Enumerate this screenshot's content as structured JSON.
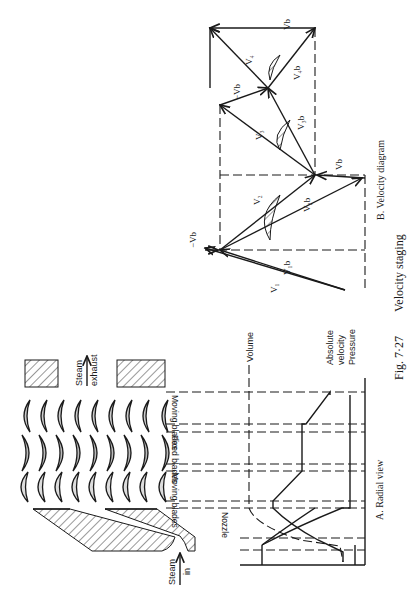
{
  "figure": {
    "number": "Fig. 7·27",
    "caption": "Velocity staging",
    "orientation": "rotated 90° clockwise (text reads bottom-to-top)"
  },
  "panel_a": {
    "title": "A. Radial view",
    "flow_labels": {
      "inlet": "Steam in",
      "inlet_line1": "Steam",
      "inlet_line2": "in",
      "exhaust_line1": "Steam",
      "exhaust_line2": "exhaust"
    },
    "sections": [
      "Nozzle",
      "Moving blades",
      "Fixed blades",
      "Moving blades"
    ],
    "curves": [
      "Volume",
      "Absolute velocity",
      "Pressure"
    ],
    "curve_label_volume": "Volume",
    "curve_label_velocity_1": "Absolute",
    "curve_label_velocity_2": "velocity",
    "curve_label_pressure": "Pressure"
  },
  "panel_b": {
    "title": "B. Velocity diagram",
    "vectors": [
      "V1",
      "V1b",
      "-Vb",
      "V2",
      "V2b",
      "Vb",
      "V3",
      "V3b",
      "-Vb",
      "V4",
      "V4b",
      "Vb"
    ],
    "labels": {
      "v1": "V₁",
      "v1b": "V₁b",
      "neg_vb_1": "−Vb",
      "v2": "V₂",
      "v2b": "V₂b",
      "vb_1": "Vb",
      "v3": "V₃",
      "v3b": "V₃b",
      "neg_vb_2": "−Vb",
      "v4": "V₄",
      "v4b": "V₄b",
      "vb_2": "Vb"
    }
  }
}
